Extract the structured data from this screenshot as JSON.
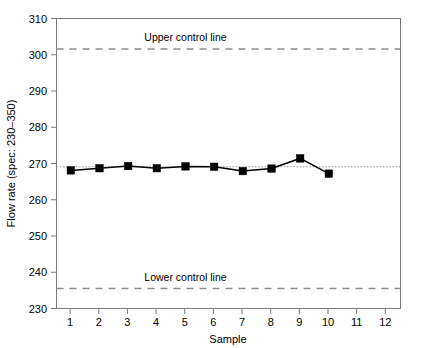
{
  "chart_data": {
    "type": "line",
    "title": "",
    "xlabel": "Sample",
    "ylabel": "Flow rate (spec: 230–350)",
    "x": [
      1,
      2,
      3,
      4,
      5,
      6,
      7,
      8,
      9,
      10
    ],
    "xticks": [
      1,
      2,
      3,
      4,
      5,
      6,
      7,
      8,
      9,
      10,
      11,
      12
    ],
    "xticklabels": [
      "1",
      "2",
      "3",
      "4",
      "5",
      "6",
      "7",
      "8",
      "9",
      "10",
      "11",
      "12"
    ],
    "xlim": [
      0.5,
      12.5
    ],
    "yticks": [
      230,
      240,
      250,
      260,
      270,
      280,
      290,
      300,
      310
    ],
    "yticklabels": [
      "230",
      "240",
      "250",
      "260",
      "270",
      "280",
      "290",
      "300",
      "310"
    ],
    "ylim": [
      230,
      310
    ],
    "grid": false,
    "legend": "none",
    "series": [
      {
        "name": "Flow rate",
        "values": [
          268.1,
          268.7,
          269.3,
          268.7,
          269.2,
          269.1,
          267.9,
          268.6,
          271.4,
          267.2
        ],
        "marker": "square",
        "color": "#000000"
      }
    ],
    "reference_lines": [
      {
        "name": "upper-control-line",
        "label": "Upper control line",
        "value": 301.6,
        "style": "dashed",
        "color": "#8c8c8c",
        "label_x": 5.0
      },
      {
        "name": "center-line",
        "label": "",
        "value": 269.1,
        "style": "dotted",
        "color": "#9a9a9a"
      },
      {
        "name": "lower-control-line",
        "label": "Lower control line",
        "value": 235.5,
        "style": "dashed",
        "color": "#8c8c8c",
        "label_x": 5.0
      }
    ]
  },
  "labels": {
    "y_axis_title": "Flow rate (spec: 230–350)",
    "x_axis_title": "Sample",
    "upper_control_line": "Upper control line",
    "lower_control_line": "Lower control line",
    "y_310": "310",
    "y_300": "300",
    "y_290": "290",
    "y_280": "280",
    "y_270": "270",
    "y_260": "260",
    "y_250": "250",
    "y_240": "240",
    "y_230": "230",
    "x_1": "1",
    "x_2": "2",
    "x_3": "3",
    "x_4": "4",
    "x_5": "5",
    "x_6": "6",
    "x_7": "7",
    "x_8": "8",
    "x_9": "9",
    "x_10": "10",
    "x_11": "11",
    "x_12": "12"
  },
  "colors": {
    "frame": "#7a7a7a",
    "control": "#8c8c8c",
    "center": "#9a9a9a",
    "series": "#000000",
    "background": "#ffffff"
  }
}
